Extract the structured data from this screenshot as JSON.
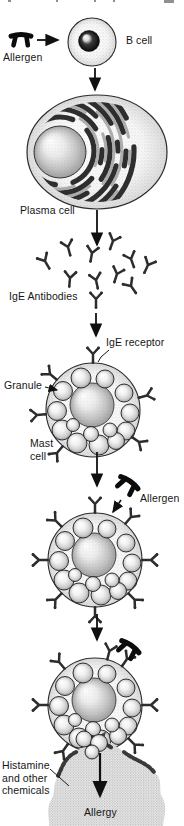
{
  "colors": {
    "ink": "#101010",
    "background": "#ffffff",
    "antibody": "#2d2d2d",
    "allergen": "#0c0c0c"
  },
  "labels": {
    "allergen_top": "Allergen",
    "b_cell": "B cell",
    "plasma_cell": "Plasma cell",
    "ige_antibodies": "IgE Antibodies",
    "ige_receptor": "IgE receptor",
    "granule": "Granule",
    "mast_cell": [
      "Mast",
      "cell"
    ],
    "allergen_mid": "Allergen",
    "histamine": [
      "Histamine",
      "and other",
      "chemicals"
    ],
    "allergy": "Allergy"
  }
}
